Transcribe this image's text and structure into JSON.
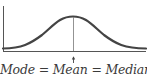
{
  "diagram": {
    "type": "normal-distribution",
    "caption": "Mode = Mean = Median",
    "colors": {
      "curve": "#444444",
      "axis": "#555555",
      "center_line": "#777777",
      "text": "#3a3a3a"
    }
  }
}
